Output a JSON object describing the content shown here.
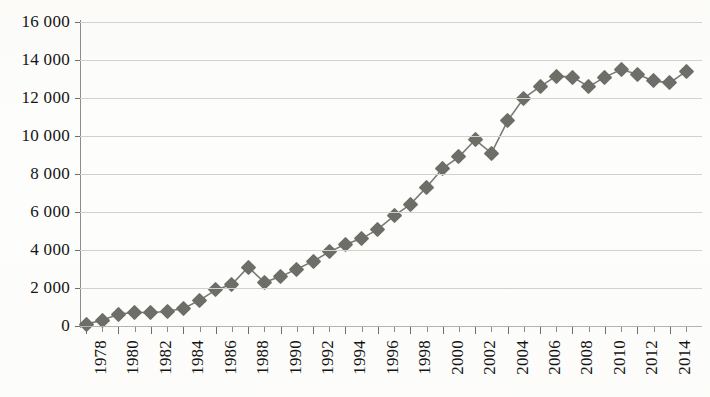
{
  "chart_data": {
    "type": "line",
    "title": "",
    "subtitle": "",
    "xlabel": "",
    "ylabel": "",
    "grid": true,
    "legend": "none",
    "marker": "diamond",
    "series_color": "#6e6e68",
    "line_color": "#7a7a74",
    "gridline_color": "#d2d2cc",
    "axis_color": "#8d8d88",
    "ylim": [
      0,
      16000
    ],
    "ytick_step": 2000,
    "ytick_labels": [
      "0",
      "2 000",
      "4 000",
      "6 000",
      "8 000",
      "10 000",
      "12 000",
      "14 000",
      "16 000"
    ],
    "ytick_values": [
      0,
      2000,
      4000,
      6000,
      8000,
      10000,
      12000,
      14000,
      16000
    ],
    "xlim": [
      1978,
      2015
    ],
    "xtick_label_step": 2,
    "xtick_labels": [
      "1978",
      "1980",
      "1982",
      "1984",
      "1986",
      "1988",
      "1990",
      "1992",
      "1994",
      "1996",
      "1998",
      "2000",
      "2002",
      "2004",
      "2006",
      "2008",
      "2010",
      "2012",
      "2014"
    ],
    "x": [
      1978,
      1979,
      1980,
      1981,
      1982,
      1983,
      1984,
      1985,
      1986,
      1987,
      1988,
      1989,
      1990,
      1991,
      1992,
      1993,
      1994,
      1995,
      1996,
      1997,
      1998,
      1999,
      2000,
      2001,
      2002,
      2003,
      2004,
      2005,
      2006,
      2007,
      2008,
      2009,
      2010,
      2011,
      2012,
      2013,
      2014,
      2015
    ],
    "values": [
      100,
      300,
      620,
      720,
      700,
      780,
      920,
      1350,
      1900,
      2200,
      3100,
      2300,
      2600,
      3000,
      3400,
      3900,
      4300,
      4600,
      5100,
      5800,
      6400,
      7300,
      8300,
      8900,
      9800,
      9100,
      10800,
      12000,
      12600,
      13150,
      13100,
      12600,
      13100,
      13500,
      13250,
      12900,
      12800,
      13400
    ]
  }
}
